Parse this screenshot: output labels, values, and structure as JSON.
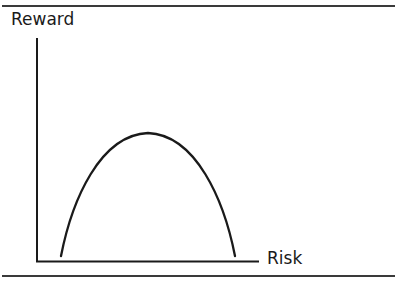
{
  "figure": {
    "top_clipped_caption": "... risk-return ... process ... strategy ...",
    "y_axis_label": "Reward",
    "x_axis_label": "Risk"
  },
  "colors": {
    "ink": "#1a1a1a",
    "rule": "#3a3a3a",
    "background": "#ffffff"
  },
  "curve": {
    "shape": "inverted-parabola",
    "description": "Reward rises with risk to a peak at moderate risk, then falls"
  }
}
